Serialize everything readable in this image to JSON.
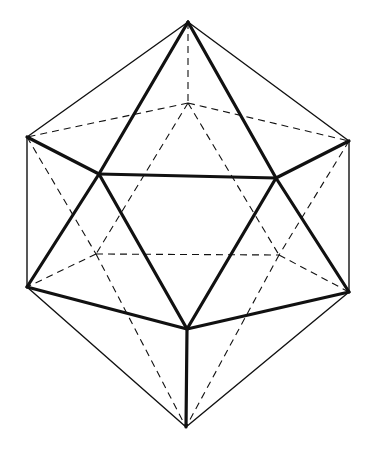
{
  "diagram": {
    "style": "wireframe line drawing",
    "colors": {
      "line": "#111111",
      "background": "#ffffff"
    },
    "vertices": [
      {
        "id": "top",
        "visible": true
      },
      {
        "id": "back-top",
        "visible": false
      },
      {
        "id": "left-upper",
        "visible": true
      },
      {
        "id": "right-upper",
        "visible": true
      },
      {
        "id": "front-upper-left",
        "visible": true
      },
      {
        "id": "front-upper-right",
        "visible": true
      },
      {
        "id": "back-lower-left",
        "visible": false
      },
      {
        "id": "back-lower-right",
        "visible": false
      },
      {
        "id": "left-lower",
        "visible": true
      },
      {
        "id": "right-lower",
        "visible": true
      },
      {
        "id": "front-bottom",
        "visible": true
      },
      {
        "id": "bottom",
        "visible": true
      }
    ],
    "edges": [
      {
        "from": "top",
        "to": "left-upper",
        "kind": "outline"
      },
      {
        "from": "top",
        "to": "right-upper",
        "kind": "outline"
      },
      {
        "from": "left-upper",
        "to": "left-lower",
        "kind": "outline"
      },
      {
        "from": "right-upper",
        "to": "right-lower",
        "kind": "outline"
      },
      {
        "from": "left-lower",
        "to": "bottom",
        "kind": "outline"
      },
      {
        "from": "right-lower",
        "to": "bottom",
        "kind": "outline"
      },
      {
        "from": "top",
        "to": "front-upper-left",
        "kind": "front"
      },
      {
        "from": "top",
        "to": "front-upper-right",
        "kind": "front"
      },
      {
        "from": "front-upper-left",
        "to": "front-upper-right",
        "kind": "front"
      },
      {
        "from": "left-upper",
        "to": "front-upper-left",
        "kind": "front"
      },
      {
        "from": "right-upper",
        "to": "front-upper-right",
        "kind": "front"
      },
      {
        "from": "front-upper-left",
        "to": "left-lower",
        "kind": "front"
      },
      {
        "from": "front-upper-right",
        "to": "right-lower",
        "kind": "front"
      },
      {
        "from": "front-upper-left",
        "to": "front-bottom",
        "kind": "front"
      },
      {
        "from": "front-upper-right",
        "to": "front-bottom",
        "kind": "front"
      },
      {
        "from": "left-lower",
        "to": "front-bottom",
        "kind": "front"
      },
      {
        "from": "right-lower",
        "to": "front-bottom",
        "kind": "front"
      },
      {
        "from": "front-bottom",
        "to": "bottom",
        "kind": "front"
      },
      {
        "from": "top",
        "to": "back-top",
        "kind": "hidden"
      },
      {
        "from": "back-top",
        "to": "left-upper",
        "kind": "hidden"
      },
      {
        "from": "back-top",
        "to": "right-upper",
        "kind": "hidden"
      },
      {
        "from": "back-top",
        "to": "back-lower-left",
        "kind": "hidden"
      },
      {
        "from": "back-top",
        "to": "back-lower-right",
        "kind": "hidden"
      },
      {
        "from": "left-upper",
        "to": "back-lower-left",
        "kind": "hidden"
      },
      {
        "from": "right-upper",
        "to": "back-lower-right",
        "kind": "hidden"
      },
      {
        "from": "back-lower-left",
        "to": "back-lower-right",
        "kind": "hidden"
      },
      {
        "from": "back-lower-left",
        "to": "left-lower",
        "kind": "hidden"
      },
      {
        "from": "back-lower-right",
        "to": "right-lower",
        "kind": "hidden"
      },
      {
        "from": "back-lower-left",
        "to": "bottom",
        "kind": "hidden"
      },
      {
        "from": "back-lower-right",
        "to": "bottom",
        "kind": "hidden"
      }
    ]
  }
}
